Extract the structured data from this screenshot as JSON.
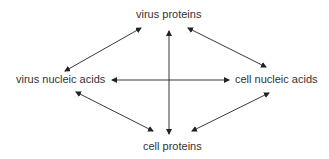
{
  "diagram": {
    "nodes": {
      "top": "virus proteins",
      "left": "virus nucleic acids",
      "right": "cell nucleic acids",
      "bottom": "cell proteins"
    },
    "edges": [
      {
        "from": "virus proteins",
        "to": "virus nucleic acids",
        "type": "bidirectional"
      },
      {
        "from": "virus proteins",
        "to": "cell nucleic acids",
        "type": "bidirectional"
      },
      {
        "from": "virus proteins",
        "to": "cell proteins",
        "type": "bidirectional"
      },
      {
        "from": "virus nucleic acids",
        "to": "cell nucleic acids",
        "type": "bidirectional"
      },
      {
        "from": "virus nucleic acids",
        "to": "cell proteins",
        "type": "bidirectional"
      },
      {
        "from": "cell nucleic acids",
        "to": "cell proteins",
        "type": "bidirectional"
      }
    ],
    "line_color": "#222222"
  }
}
